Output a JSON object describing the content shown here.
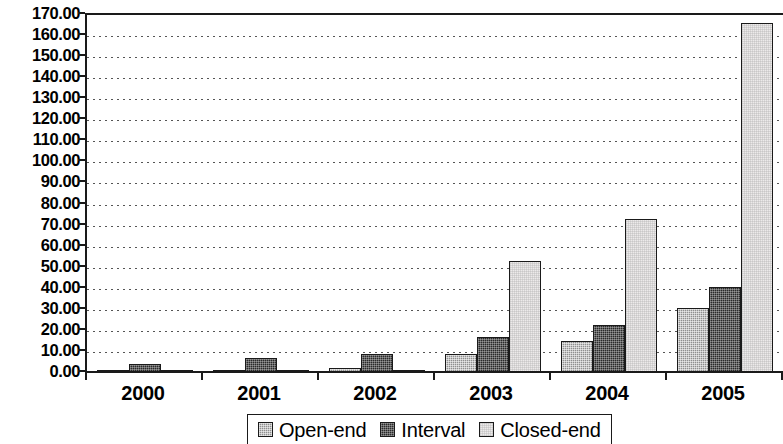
{
  "chart_data": {
    "type": "bar",
    "title": "",
    "subtitle": "",
    "xlabel": "",
    "ylabel": "",
    "categories": [
      "2000",
      "2001",
      "2002",
      "2003",
      "2004",
      "2005"
    ],
    "series": [
      {
        "name": "Open-end",
        "values": [
          0.5,
          1.5,
          2.5,
          9.0,
          15.0,
          31.0
        ]
      },
      {
        "name": "Interval",
        "values": [
          4.5,
          7.0,
          9.0,
          17.0,
          23.0,
          41.0
        ]
      },
      {
        "name": "Closed-end",
        "values": [
          0.3,
          0.4,
          0.8,
          53.0,
          73.0,
          166.0
        ]
      }
    ],
    "ylim": [
      0,
      170
    ],
    "ytick_step": 10,
    "ytick_labels": [
      "170.00",
      "160.00",
      "150.00",
      "140.00",
      "130.00",
      "120.00",
      "110.00",
      "100.00",
      "90.00",
      "80.00",
      "70.00",
      "60.00",
      "50.00",
      "40.00",
      "30.00",
      "20.00",
      "10.00",
      "0.00"
    ],
    "ytick_values": [
      170,
      160,
      150,
      140,
      130,
      120,
      110,
      100,
      90,
      80,
      70,
      60,
      50,
      40,
      30,
      20,
      10,
      0
    ],
    "grid": true,
    "grid_style": "dotted",
    "legend_position": "bottom",
    "legend": [
      {
        "label": "Open-end",
        "swatch": "open-end",
        "color": "#8f8f8f"
      },
      {
        "label": "Interval",
        "swatch": "interval",
        "color": "#2a2a2a"
      },
      {
        "label": "Closed-end",
        "swatch": "closed-end",
        "color": "#eceaea"
      }
    ]
  }
}
